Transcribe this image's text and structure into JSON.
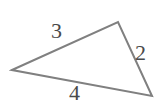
{
  "figure": {
    "type": "triangle-diagram",
    "background_color": "#ffffff",
    "stroke_color": "#808080",
    "stroke_width": 2,
    "label_color": "#4a4a4a",
    "canvas": {
      "width": 165,
      "height": 103
    },
    "vertices": [
      {
        "name": "left-vertex",
        "x": 12,
        "y": 70
      },
      {
        "name": "top-vertex",
        "x": 118,
        "y": 22
      },
      {
        "name": "bottom-right-vertex",
        "x": 152,
        "y": 96
      }
    ],
    "polygon_points": "12,70 118,22 152,96",
    "sides": [
      {
        "name": "upper-left-side",
        "label": "3",
        "from": "left-vertex",
        "to": "top-vertex"
      },
      {
        "name": "right-side",
        "label": "2",
        "from": "top-vertex",
        "to": "bottom-right-vertex"
      },
      {
        "name": "bottom-side",
        "label": "4",
        "from": "left-vertex",
        "to": "bottom-right-vertex"
      }
    ],
    "labels": {
      "upper_left": "3",
      "right": "2",
      "bottom": "4"
    }
  }
}
